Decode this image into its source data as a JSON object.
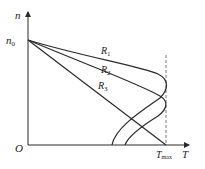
{
  "diagram": {
    "title": "",
    "axes": {
      "y_label": "n",
      "x_label": "T",
      "origin_label": "O",
      "y_tick_label": "n",
      "y_tick_sub": "0",
      "x_tick_label": "T",
      "x_tick_sub": "max"
    },
    "curves": [
      {
        "name": "R",
        "sub": "1"
      },
      {
        "name": "R",
        "sub": "2"
      },
      {
        "name": "R",
        "sub": "3"
      }
    ],
    "colors": {
      "line": "#2a2a2a",
      "dashed": "#555555"
    }
  }
}
